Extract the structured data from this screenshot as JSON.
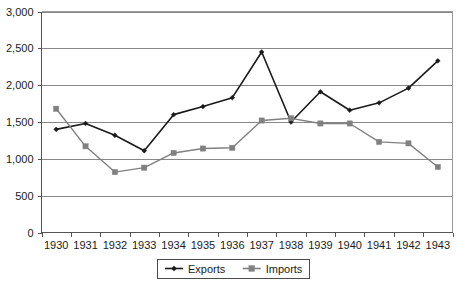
{
  "chart_data": {
    "type": "line",
    "title": "",
    "subtitle": "",
    "xlabel": "",
    "ylabel": "",
    "categories": [
      "1930",
      "1931",
      "1932",
      "1933",
      "1934",
      "1935",
      "1936",
      "1937",
      "1938",
      "1939",
      "1940",
      "1941",
      "1942",
      "1943"
    ],
    "series": [
      {
        "name": "Exports",
        "color": "#1a1a1a",
        "marker": "diamond",
        "values": [
          1400,
          1480,
          1320,
          1110,
          1600,
          1710,
          1830,
          2450,
          1500,
          1910,
          1660,
          1760,
          1960,
          2330
        ]
      },
      {
        "name": "Imports",
        "color": "#808080",
        "marker": "square",
        "values": [
          1680,
          1170,
          820,
          880,
          1080,
          1140,
          1150,
          1520,
          1550,
          1480,
          1480,
          1230,
          1210,
          890
        ]
      }
    ],
    "ylim": [
      0,
      3000
    ],
    "ytick_values": [
      0,
      500,
      1000,
      1500,
      2000,
      2500,
      3000
    ],
    "ytick_labels": [
      "0",
      "500",
      "1,000",
      "1,500",
      "2,000",
      "2,500",
      "3,000"
    ],
    "grid": true,
    "grid_axis": "y",
    "legend_position": "bottom",
    "legend_entries": [
      "Exports",
      "Imports"
    ]
  },
  "colors": {
    "exports": "#1a1a1a",
    "imports": "#808080",
    "gridline": "#888888",
    "frame": "#9a9a9a",
    "background": "#ffffff"
  }
}
